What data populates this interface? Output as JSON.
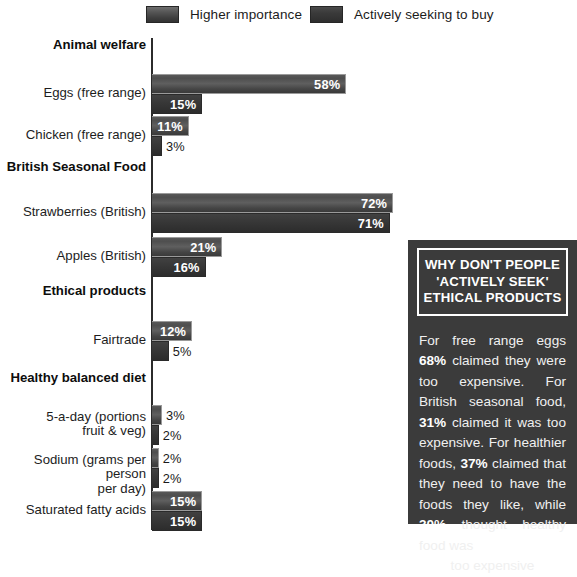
{
  "legend": {
    "items": [
      {
        "key": "higher-importance",
        "label": "Higher importance",
        "color": "#4e4e4e"
      },
      {
        "key": "actively-seeking",
        "label": "Actively seeking to buy",
        "color": "#333333"
      }
    ]
  },
  "chart_data": {
    "type": "bar",
    "orientation": "horizontal",
    "title": "",
    "xlabel": "",
    "ylabel": "",
    "xlim": [
      0,
      75
    ],
    "grid": false,
    "legend_position": "top",
    "categories": [
      "Animal welfare",
      "Eggs (free range)",
      "Chicken (free range)",
      "British Seasonal Food",
      "Strawberries (British)",
      "Apples (British)",
      "Ethical products",
      "Fairtrade",
      "Healthy balanced diet",
      "5-a-day (portions\nfruit & veg)",
      "Sodium (grams per person\nper day)",
      "Saturated fatty acids"
    ],
    "series": [
      {
        "name": "Higher importance",
        "values": [
          null,
          58,
          11,
          null,
          72,
          21,
          null,
          12,
          null,
          3,
          2,
          15
        ]
      },
      {
        "name": "Actively seeking to buy",
        "values": [
          null,
          15,
          3,
          null,
          71,
          16,
          null,
          5,
          null,
          2,
          2,
          15
        ]
      }
    ],
    "rows": [
      {
        "label": "Animal welfare",
        "header": true,
        "top": 8,
        "bars": []
      },
      {
        "label": "Eggs (free range)",
        "header": false,
        "top": 44,
        "bars": [
          {
            "series": "Higher importance",
            "value": 58,
            "text": "58%",
            "inside": true
          },
          {
            "series": "Actively seeking to buy",
            "value": 15,
            "text": "15%",
            "inside": true
          }
        ]
      },
      {
        "label": "Chicken (free range)",
        "header": false,
        "top": 86,
        "bars": [
          {
            "series": "Higher importance",
            "value": 11,
            "text": "11%",
            "inside": true
          },
          {
            "series": "Actively seeking to buy",
            "value": 3,
            "text": "3%",
            "inside": false
          }
        ]
      },
      {
        "label": "British Seasonal Food",
        "header": true,
        "top": 130,
        "bars": []
      },
      {
        "label": "Strawberries (British)",
        "header": false,
        "top": 163,
        "bars": [
          {
            "series": "Higher importance",
            "value": 72,
            "text": "72%",
            "inside": true
          },
          {
            "series": "Actively seeking to buy",
            "value": 71,
            "text": "71%",
            "inside": true
          }
        ]
      },
      {
        "label": "Apples (British)",
        "header": false,
        "top": 207,
        "bars": [
          {
            "series": "Higher importance",
            "value": 21,
            "text": "21%",
            "inside": true
          },
          {
            "series": "Actively seeking to buy",
            "value": 16,
            "text": "16%",
            "inside": true
          }
        ]
      },
      {
        "label": "Ethical products",
        "header": true,
        "top": 254,
        "bars": []
      },
      {
        "label": "Fairtrade",
        "header": false,
        "top": 291,
        "bars": [
          {
            "series": "Higher importance",
            "value": 12,
            "text": "12%",
            "inside": true
          },
          {
            "series": "Actively seeking to buy",
            "value": 5,
            "text": "5%",
            "inside": false
          }
        ]
      },
      {
        "label": "Healthy balanced diet",
        "header": true,
        "top": 341,
        "bars": []
      },
      {
        "label": "5-a-day (portions\nfruit & veg)",
        "header": false,
        "top": 375,
        "bars": [
          {
            "series": "Higher importance",
            "value": 3,
            "text": "3%",
            "inside": false
          },
          {
            "series": "Actively seeking to buy",
            "value": 2,
            "text": "2%",
            "inside": false
          }
        ]
      },
      {
        "label": "Sodium (grams per person\nper day)",
        "header": false,
        "top": 418,
        "bars": [
          {
            "series": "Higher importance",
            "value": 2,
            "text": "2%",
            "inside": false
          },
          {
            "series": "Actively seeking to buy",
            "value": 2,
            "text": "2%",
            "inside": false
          }
        ]
      },
      {
        "label": "Saturated fatty acids",
        "header": false,
        "top": 461,
        "bars": [
          {
            "series": "Higher importance",
            "value": 15,
            "text": "15%",
            "inside": true
          },
          {
            "series": "Actively seeking to buy",
            "value": 15,
            "text": "15%",
            "inside": true
          }
        ]
      }
    ]
  },
  "panel": {
    "heading_lines": [
      "WHY DON'T PEOPLE",
      "'ACTIVELY SEEK'",
      "ETHICAL PRODUCTS"
    ],
    "body_html": "For free range eggs <b>68%</b> claimed they were too expensive. For British seasonal food, <b>31%</b> claimed it was too expensive. For healthier foods, <b>37%</b> claimed that they need to have the foods they like, while <b>30%</b> thought healthy food was",
    "body_last_line": "too expensive",
    "background": "#3b3b3b",
    "text_color": "#f0f0f0"
  },
  "scale": {
    "px_per_percent": 3.35,
    "axis_x": 152
  }
}
